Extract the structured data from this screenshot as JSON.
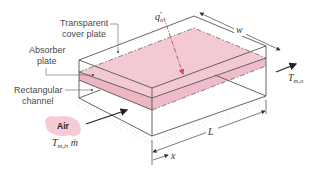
{
  "figure": {
    "type": "schematic"
  },
  "labels": {
    "cover_plate": [
      "Transparent",
      "cover plate"
    ],
    "absorber_plate": [
      "Absorber",
      "plate"
    ],
    "channel": [
      "Rectangular",
      "channel"
    ],
    "air_bubble": "Air",
    "heat_flux": {
      "base": "q",
      "sub": "o",
      "sup": "\""
    },
    "inlet": {
      "T": "T",
      "T_sub": "m,i",
      "sep": ", ",
      "mdot": "ṁ"
    },
    "outlet": {
      "T": "T",
      "T_sub": "m,o"
    },
    "width_dim": "w",
    "length_dim": "L",
    "axis": "x"
  },
  "colors": {
    "absorber_fill": "#f2c4cf",
    "heat_flux_arrow": "#c0506e",
    "air_bubble": "#f5cbd5",
    "lines": "#555555",
    "ground_stipple": "#aaaaaa"
  }
}
